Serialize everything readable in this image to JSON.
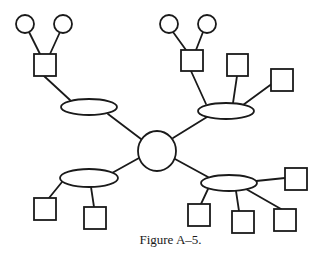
{
  "figure": {
    "caption": "Figure A–5.",
    "stroke_color": "#1a1a1a",
    "background": "#ffffff"
  },
  "nodes": {
    "hub": {
      "shape": "circle",
      "cx": 157,
      "cy": 151,
      "rx": 19,
      "ry": 20
    },
    "ellipses": [
      {
        "id": "top-left-ellipse",
        "cx": 89,
        "cy": 107,
        "rx": 28,
        "ry": 8
      },
      {
        "id": "top-right-ellipse",
        "cx": 226,
        "cy": 111,
        "rx": 28,
        "ry": 8
      },
      {
        "id": "bottom-left-ellipse",
        "cx": 89,
        "cy": 178,
        "rx": 29,
        "ry": 9
      },
      {
        "id": "bottom-right-ellipse",
        "cx": 229,
        "cy": 183,
        "rx": 28,
        "ry": 8
      }
    ],
    "squares": [
      {
        "id": "tl-square",
        "x": 34,
        "y": 54,
        "w": 22,
        "h": 22
      },
      {
        "id": "tr-square-1",
        "x": 181,
        "y": 50,
        "w": 22,
        "h": 21
      },
      {
        "id": "tr-square-2",
        "x": 227,
        "y": 54,
        "w": 21,
        "h": 22
      },
      {
        "id": "tr-square-3",
        "x": 271,
        "y": 69,
        "w": 22,
        "h": 22
      },
      {
        "id": "bl-square-1",
        "x": 34,
        "y": 198,
        "w": 22,
        "h": 22
      },
      {
        "id": "bl-square-2",
        "x": 84,
        "y": 207,
        "w": 22,
        "h": 22
      },
      {
        "id": "br-square-1",
        "x": 188,
        "y": 204,
        "w": 22,
        "h": 22
      },
      {
        "id": "br-square-2",
        "x": 232,
        "y": 211,
        "w": 22,
        "h": 22
      },
      {
        "id": "br-square-3",
        "x": 274,
        "y": 209,
        "w": 22,
        "h": 22
      },
      {
        "id": "br-square-4",
        "x": 285,
        "y": 168,
        "w": 22,
        "h": 22
      }
    ],
    "small_circles": [
      {
        "id": "tl-circle-1",
        "cx": 25,
        "cy": 24,
        "r": 9
      },
      {
        "id": "tl-circle-2",
        "cx": 63,
        "cy": 24,
        "r": 9
      },
      {
        "id": "tr-circle-1",
        "cx": 169,
        "cy": 24,
        "r": 9
      },
      {
        "id": "tr-circle-2",
        "cx": 207,
        "cy": 24,
        "r": 9
      }
    ]
  },
  "edges": [
    {
      "from": "hub",
      "to": "top-left-ellipse",
      "x1": 141,
      "y1": 139,
      "x2": 108,
      "y2": 114
    },
    {
      "from": "hub",
      "to": "top-right-ellipse",
      "x1": 173,
      "y1": 138,
      "x2": 207,
      "y2": 117
    },
    {
      "from": "hub",
      "to": "bottom-left-ellipse",
      "x1": 139,
      "y1": 158,
      "x2": 112,
      "y2": 173
    },
    {
      "from": "hub",
      "to": "bottom-right-ellipse",
      "x1": 175,
      "y1": 159,
      "x2": 208,
      "y2": 177
    },
    {
      "from": "top-left-ellipse",
      "to": "tl-square",
      "x1": 70,
      "y1": 100,
      "x2": 44,
      "y2": 76
    },
    {
      "from": "tl-square",
      "to": "tl-circle-1",
      "x1": 40,
      "y1": 54,
      "x2": 29,
      "y2": 32
    },
    {
      "from": "tl-square",
      "to": "tl-circle-2",
      "x1": 50,
      "y1": 54,
      "x2": 60,
      "y2": 32
    },
    {
      "from": "top-right-ellipse",
      "to": "tr-square-1",
      "x1": 206,
      "y1": 104,
      "x2": 191,
      "y2": 71
    },
    {
      "from": "top-right-ellipse",
      "to": "tr-square-2",
      "x1": 233,
      "y1": 103,
      "x2": 237,
      "y2": 76
    },
    {
      "from": "top-right-ellipse",
      "to": "tr-square-3",
      "x1": 243,
      "y1": 105,
      "x2": 273,
      "y2": 83
    },
    {
      "from": "tr-square-1",
      "to": "tr-circle-1",
      "x1": 186,
      "y1": 50,
      "x2": 173,
      "y2": 32
    },
    {
      "from": "tr-square-1",
      "to": "tr-circle-2",
      "x1": 196,
      "y1": 50,
      "x2": 203,
      "y2": 32
    },
    {
      "from": "bottom-left-ellipse",
      "to": "bl-square-1",
      "x1": 62,
      "y1": 182,
      "x2": 49,
      "y2": 198
    },
    {
      "from": "bottom-left-ellipse",
      "to": "bl-square-2",
      "x1": 91,
      "y1": 187,
      "x2": 94,
      "y2": 207
    },
    {
      "from": "bottom-right-ellipse",
      "to": "br-square-1",
      "x1": 208,
      "y1": 189,
      "x2": 201,
      "y2": 204
    },
    {
      "from": "bottom-right-ellipse",
      "to": "br-square-2",
      "x1": 236,
      "y1": 191,
      "x2": 239,
      "y2": 211
    },
    {
      "from": "bottom-right-ellipse",
      "to": "br-square-3",
      "x1": 246,
      "y1": 189,
      "x2": 281,
      "y2": 209
    },
    {
      "from": "bottom-right-ellipse",
      "to": "br-square-4",
      "x1": 256,
      "y1": 181,
      "x2": 285,
      "y2": 178
    }
  ]
}
